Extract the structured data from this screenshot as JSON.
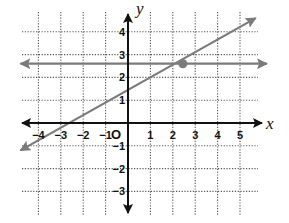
{
  "chart_data": {
    "type": "line",
    "title": "",
    "xlabel": "x",
    "ylabel": "y",
    "origin_label": "O",
    "xlim": [
      -4.7,
      5.7
    ],
    "ylim": [
      -4,
      5
    ],
    "grid": true,
    "grid_style": "dotted",
    "x_ticks": [
      -4,
      -3,
      -2,
      -1,
      1,
      2,
      3,
      4,
      5
    ],
    "y_ticks": [
      -3,
      -2,
      -1,
      1,
      2,
      3,
      4
    ],
    "x_tick_labels": [
      "−4",
      "−3",
      "−2",
      "−1",
      "1",
      "2",
      "3",
      "4",
      "5"
    ],
    "y_tick_labels": [
      "−3",
      "−2",
      "−1",
      "1",
      "2",
      "3",
      "4"
    ],
    "series": [
      {
        "name": "horizontal line",
        "equation": "y = 2.6",
        "points": [
          [
            -4.8,
            2.6
          ],
          [
            6.2,
            2.6
          ]
        ],
        "arrows": "both",
        "color": "#7a7a7a"
      },
      {
        "name": "slanted line",
        "equation": "y ≈ 0.6x + 1.1",
        "points": [
          [
            -4.8,
            -1.2
          ],
          [
            5.7,
            4.6
          ]
        ],
        "arrows": "both",
        "color": "#7a7a7a"
      }
    ],
    "annotations": [
      {
        "type": "intersection-point",
        "x": 2.45,
        "y": 2.6
      }
    ],
    "legend": null
  },
  "colors": {
    "axis": "#111111",
    "grid": "#555555",
    "lines": "#7a7a7a",
    "background": "#ffffff"
  }
}
